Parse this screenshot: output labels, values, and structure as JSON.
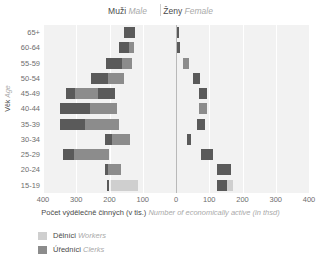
{
  "header": {
    "male_cz": "Muži",
    "male_en": "Male",
    "female_cz": "Ženy",
    "female_en": "Female"
  },
  "axes": {
    "y_title_cz": "Věk",
    "y_title_en": "Age",
    "x_title_cz": "Počet výdělečně činných (v tis.)",
    "x_title_en": "Number of economically active (in thsd)",
    "x_ticks": [
      "400",
      "300",
      "200",
      "100",
      "0",
      "100",
      "200",
      "300",
      "400"
    ]
  },
  "legend": [
    {
      "label_cz": "Dělníci",
      "label_en": "Workers",
      "color": "#cfcfcf"
    },
    {
      "label_cz": "Úředníci",
      "label_en": "Clerks",
      "color": "#8c8c8c"
    }
  ],
  "colors": {
    "plot_background": "#f2f2f2",
    "gridline": "#ffffff",
    "centerline": "#b9b9b9",
    "workers": "#cfcfcf",
    "mid": "#8c8c8c",
    "dark": "#5a5a5a",
    "text_cz": "#4a4a4a",
    "text_en": "#a9a9a9",
    "tick_text": "#6e6e6e"
  },
  "chart_data": {
    "type": "bar",
    "subtype": "population-pyramid-stacked-floating",
    "title": "",
    "xlabel": "Počet výdělečně činných (v tis.) / Number of economically active (in thsd)",
    "ylabel": "Věk / Age",
    "xlim": [
      -400,
      400
    ],
    "x_tick_values": [
      -400,
      -300,
      -200,
      -100,
      0,
      100,
      200,
      300,
      400
    ],
    "x_tick_labels": [
      "400",
      "300",
      "200",
      "100",
      "0",
      "100",
      "200",
      "300",
      "400"
    ],
    "grid": true,
    "legend_position": "below",
    "categories": [
      "65+",
      "60-64",
      "55-59",
      "50-54",
      "45-49",
      "40-44",
      "35-39",
      "30-34",
      "25-29",
      "20-24",
      "15-19"
    ],
    "series": [
      {
        "name": "Muži / Male",
        "side": "left",
        "bars": [
          {
            "category": "65+",
            "start": 155,
            "segments": [
              {
                "value": 33,
                "color": "#5a5a5a"
              }
            ]
          },
          {
            "category": "60-64",
            "start": 170,
            "segments": [
              {
                "value": 30,
                "color": "#5a5a5a"
              },
              {
                "value": 14,
                "color": "#8c8c8c"
              }
            ]
          },
          {
            "category": "55-59",
            "start": 210,
            "segments": [
              {
                "value": 48,
                "color": "#5a5a5a"
              },
              {
                "value": 30,
                "color": "#8c8c8c"
              }
            ]
          },
          {
            "category": "50-54",
            "start": 255,
            "segments": [
              {
                "value": 50,
                "color": "#5a5a5a"
              },
              {
                "value": 50,
                "color": "#8c8c8c"
              }
            ]
          },
          {
            "category": "45-49",
            "start": 330,
            "segments": [
              {
                "value": 26,
                "color": "#5a5a5a"
              },
              {
                "value": 70,
                "color": "#8c8c8c"
              },
              {
                "value": 52,
                "color": "#5a5a5a"
              }
            ]
          },
          {
            "category": "40-44",
            "start": 348,
            "segments": [
              {
                "value": 88,
                "color": "#5a5a5a"
              },
              {
                "value": 84,
                "color": "#8c8c8c"
              }
            ]
          },
          {
            "category": "35-39",
            "start": 348,
            "segments": [
              {
                "value": 74,
                "color": "#5a5a5a"
              },
              {
                "value": 102,
                "color": "#8c8c8c"
              }
            ]
          },
          {
            "category": "30-34",
            "start": 215,
            "segments": [
              {
                "value": 24,
                "color": "#5a5a5a"
              },
              {
                "value": 52,
                "color": "#8c8c8c"
              }
            ]
          },
          {
            "category": "25-29",
            "start": 340,
            "segments": [
              {
                "value": 34,
                "color": "#5a5a5a"
              },
              {
                "value": 104,
                "color": "#8c8c8c"
              }
            ]
          },
          {
            "category": "20-24",
            "start": 215,
            "segments": [
              {
                "value": 10,
                "color": "#5a5a5a"
              },
              {
                "value": 40,
                "color": "#8c8c8c"
              }
            ]
          },
          {
            "category": "15-19",
            "start": 208,
            "segments": [
              {
                "value": 8,
                "color": "#5a5a5a"
              },
              {
                "value": 6,
                "color": "#f2f2f2"
              },
              {
                "value": 80,
                "color": "#cfcfcf"
              }
            ]
          }
        ]
      },
      {
        "name": "Ženy / Female",
        "side": "right",
        "bars": [
          {
            "category": "65+",
            "start": 2,
            "segments": [
              {
                "value": 8,
                "color": "#5a5a5a"
              }
            ]
          },
          {
            "category": "60-64",
            "start": 2,
            "segments": [
              {
                "value": 9,
                "color": "#5a5a5a"
              }
            ]
          },
          {
            "category": "55-59",
            "start": 22,
            "segments": [
              {
                "value": 16,
                "color": "#8c8c8c"
              }
            ]
          },
          {
            "category": "50-54",
            "start": 52,
            "segments": [
              {
                "value": 20,
                "color": "#5a5a5a"
              }
            ]
          },
          {
            "category": "45-49",
            "start": 70,
            "segments": [
              {
                "value": 22,
                "color": "#5a5a5a"
              }
            ]
          },
          {
            "category": "40-44",
            "start": 70,
            "segments": [
              {
                "value": 24,
                "color": "#8c8c8c"
              }
            ]
          },
          {
            "category": "35-39",
            "start": 62,
            "segments": [
              {
                "value": 26,
                "color": "#5a5a5a"
              }
            ]
          },
          {
            "category": "30-34",
            "start": 34,
            "segments": [
              {
                "value": 12,
                "color": "#5a5a5a"
              }
            ]
          },
          {
            "category": "25-29",
            "start": 74,
            "segments": [
              {
                "value": 38,
                "color": "#5a5a5a"
              }
            ]
          },
          {
            "category": "20-24",
            "start": 122,
            "segments": [
              {
                "value": 44,
                "color": "#5a5a5a"
              }
            ]
          },
          {
            "category": "15-19",
            "start": 122,
            "segments": [
              {
                "value": 18,
                "color": "#cfcfcf"
              },
              {
                "value": 30,
                "color": "#5a5a5a"
              }
            ]
          }
        ]
      }
    ]
  }
}
